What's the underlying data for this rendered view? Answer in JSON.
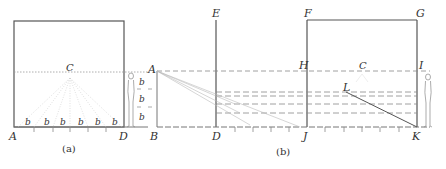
{
  "figure": {
    "panel_a": {
      "caption": "(a)",
      "labels": {
        "A": "A",
        "C": "C",
        "D": "D"
      },
      "b_labels": [
        "b",
        "b",
        "b",
        "b",
        "b",
        "b"
      ],
      "side_b_labels": [
        "b",
        "b",
        "b"
      ]
    },
    "panel_b": {
      "caption": "(b)",
      "labels": {
        "A": "A",
        "B": "B",
        "D": "D",
        "E": "E",
        "F": "F",
        "G": "G",
        "H": "H",
        "C": "C",
        "I": "I",
        "J": "J",
        "K": "K",
        "L": "L"
      },
      "side_b_labels": [
        "b",
        "b",
        "b"
      ]
    }
  },
  "colors": {
    "line": "#555555",
    "faint": "#bbbbbb",
    "text": "#333333"
  }
}
